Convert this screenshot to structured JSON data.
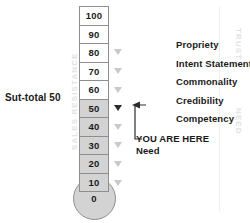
{
  "diagram": {
    "axis_left_label": "SALES RESISTANCE",
    "axis_right_top_label": "TRUST",
    "axis_right_bottom_label": "NEED",
    "subtotal_label": "Sut-total 50",
    "you_are_here_label": "YOU ARE HERE",
    "need_label": "Need",
    "bulb_value": "0",
    "scale": [
      {
        "value": "100",
        "filled": false,
        "tick": "none"
      },
      {
        "value": "90",
        "filled": false,
        "tick": "none"
      },
      {
        "value": "80",
        "filled": false,
        "tick": "light"
      },
      {
        "value": "70",
        "filled": false,
        "tick": "light"
      },
      {
        "value": "60",
        "filled": false,
        "tick": "light"
      },
      {
        "value": "50",
        "filled": true,
        "tick": "dark"
      },
      {
        "value": "40",
        "filled": true,
        "tick": "light"
      },
      {
        "value": "30",
        "filled": true,
        "tick": "light"
      },
      {
        "value": "20",
        "filled": true,
        "tick": "light"
      },
      {
        "value": "10",
        "filled": true,
        "tick": "light"
      }
    ],
    "features": [
      "Propriety",
      "Intent Statement",
      "Commonality",
      "Credibility",
      "Competency"
    ],
    "colors": {
      "fill": "#d3d3d3",
      "empty": "#ffffff",
      "outline": "#8e8e8e",
      "text": "#1a1a1a",
      "faint_axis_text": "#e2e2e2",
      "tick_light": "#c9c9c9",
      "tick_dark": "#2b2b2b"
    }
  },
  "chart_data": {
    "type": "bar",
    "xlabel": "",
    "ylabel": "SALES RESISTANCE",
    "ylim": [
      0,
      100
    ],
    "categories": [
      "10",
      "20",
      "30",
      "40",
      "50",
      "60",
      "70",
      "80",
      "90",
      "100"
    ],
    "values": [
      1,
      1,
      1,
      1,
      1,
      0,
      0,
      0,
      0,
      0
    ],
    "current_value": 50,
    "annotations": [
      "Sut-total 50",
      "YOU ARE HERE",
      "Need",
      "TRUST",
      "NEED",
      "SALES RESISTANCE"
    ],
    "legend": [
      "Propriety",
      "Intent Statement",
      "Commonality",
      "Credibility",
      "Competency"
    ],
    "grid": false
  }
}
